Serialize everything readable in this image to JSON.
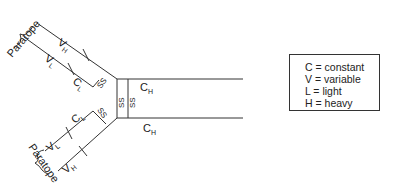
{
  "diagram": {
    "labels": {
      "paratope_top": "Paratope",
      "paratope_bottom": "Paratope",
      "vh_top": "V",
      "vh_top_sub": "H",
      "vl_top": "V",
      "vl_top_sub": "L",
      "cl_top": "C",
      "cl_top_sub": "L",
      "ch_top": "C",
      "ch_top_sub": "H",
      "ch_bottom": "C",
      "ch_bottom_sub": "H",
      "cl_bottom": "C",
      "cl_bottom_sub": "L",
      "vl_bottom": "V",
      "vl_bottom_sub": "L",
      "vh_bottom": "V",
      "vh_bottom_sub": "H",
      "ss": "SS"
    },
    "line_color": "#333333"
  },
  "legend": {
    "items": [
      "C = constant",
      "V = variable",
      "L = light",
      "H = heavy"
    ]
  }
}
